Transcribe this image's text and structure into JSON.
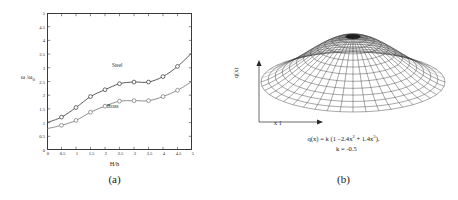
{
  "figure": {
    "background": "#ffffff",
    "panels": [
      {
        "caption": "(a)"
      },
      {
        "caption": "(b)"
      }
    ]
  },
  "panel_a": {
    "caption": "(a)",
    "xlabel": "H/h",
    "ylabel_main": "ω /ω",
    "ylabel_sub": "0",
    "series_labels": {
      "steel": "Steel",
      "brass": "Brass"
    }
  },
  "panel_b": {
    "caption": "(b)",
    "xlabel": "x 1",
    "ylabel": "q(x)",
    "equation_line_1_a": "q(x) = k (1 –2.4x",
    "equation_line_1_sup1": "2",
    "equation_line_1_b": " + 1.4x",
    "equation_line_1_sup2": "3",
    "equation_line_1_c": "),",
    "equation_line_2": "k = -0.5"
  },
  "chart_data": [
    {
      "type": "line",
      "panel": "(a)",
      "title": "",
      "xlabel": "H/h",
      "ylabel": "ω/ω₀",
      "xlim": [
        0,
        5
      ],
      "ylim": [
        0,
        5
      ],
      "xticks": [
        "0",
        "0.5",
        "1",
        "1.5",
        "2",
        "2.5",
        "3",
        "3.5",
        "4",
        "4.5",
        "5"
      ],
      "xtick_values": [
        0,
        0.5,
        1,
        1.5,
        2,
        2.5,
        3,
        3.5,
        4,
        4.5,
        5
      ],
      "yticks": [
        "0",
        "0.5",
        "1",
        "1.5",
        "2",
        "2.5",
        "3",
        "3.5",
        "4",
        "4.5",
        "5"
      ],
      "ytick_values": [
        0,
        0.5,
        1,
        1.5,
        2,
        2.5,
        3,
        3.5,
        4,
        4.5,
        5
      ],
      "grid": false,
      "legend_position": "inline-annotation",
      "marker": "open-circle",
      "series": [
        {
          "name": "Steel",
          "color": "#3f3f3f",
          "x": [
            0,
            0.5,
            1,
            1.5,
            2,
            2.5,
            3,
            3.5,
            4,
            4.5,
            5
          ],
          "values": [
            1.0,
            1.2,
            1.55,
            1.95,
            2.2,
            2.42,
            2.48,
            2.48,
            2.68,
            3.05,
            3.55
          ]
        },
        {
          "name": "Brass",
          "color": "#7a7a7a",
          "x": [
            0,
            0.5,
            1,
            1.5,
            2,
            2.5,
            3,
            3.5,
            4,
            4.5,
            5
          ],
          "values": [
            0.78,
            0.9,
            1.08,
            1.38,
            1.6,
            1.78,
            1.8,
            1.8,
            1.95,
            2.18,
            2.5
          ]
        }
      ]
    },
    {
      "type": "surface",
      "panel": "(b)",
      "title": "",
      "xlabel": "x 1",
      "ylabel": "q(x)",
      "equation": "q(x) = k (1 -2.4x^2 + 1.4x^3), k = -0.5",
      "k": -0.5,
      "coefficients": {
        "constant": 1,
        "x2": -2.4,
        "x3": 1.4
      },
      "grid": true,
      "description": "axisymmetric mesh surface, dome shaped with central depression"
    }
  ]
}
